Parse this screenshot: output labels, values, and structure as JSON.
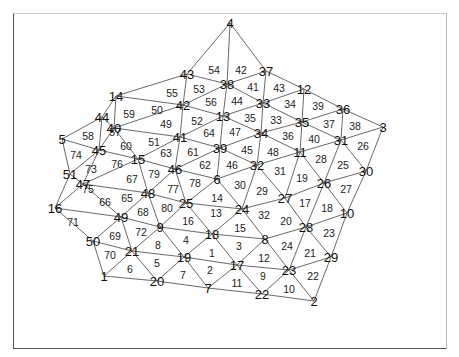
{
  "figure": {
    "type": "triangular-mesh",
    "nodes": [
      {
        "id": "4",
        "x": 230,
        "y": 23
      },
      {
        "id": "43",
        "x": 187,
        "y": 74
      },
      {
        "id": "37",
        "x": 266,
        "y": 71
      },
      {
        "id": "38",
        "x": 227,
        "y": 84
      },
      {
        "id": "14",
        "x": 116,
        "y": 96
      },
      {
        "id": "42",
        "x": 183,
        "y": 105
      },
      {
        "id": "12",
        "x": 304,
        "y": 89
      },
      {
        "id": "36",
        "x": 343,
        "y": 109
      },
      {
        "id": "33",
        "x": 263,
        "y": 103
      },
      {
        "id": "13",
        "x": 223,
        "y": 116
      },
      {
        "id": "35",
        "x": 302,
        "y": 122
      },
      {
        "id": "3",
        "x": 383,
        "y": 127
      },
      {
        "id": "44",
        "x": 102,
        "y": 117
      },
      {
        "id": "40",
        "x": 114,
        "y": 128
      },
      {
        "id": "5",
        "x": 62,
        "y": 139
      },
      {
        "id": "41",
        "x": 180,
        "y": 137
      },
      {
        "id": "34",
        "x": 261,
        "y": 133
      },
      {
        "id": "31",
        "x": 341,
        "y": 140
      },
      {
        "id": "39",
        "x": 220,
        "y": 148
      },
      {
        "id": "45",
        "x": 99,
        "y": 150
      },
      {
        "id": "15",
        "x": 138,
        "y": 159
      },
      {
        "id": "11",
        "x": 300,
        "y": 152
      },
      {
        "id": "30",
        "x": 366,
        "y": 171
      },
      {
        "id": "46",
        "x": 175,
        "y": 169
      },
      {
        "id": "6",
        "x": 217,
        "y": 179
      },
      {
        "id": "32",
        "x": 257,
        "y": 165
      },
      {
        "id": "51",
        "x": 70,
        "y": 174
      },
      {
        "id": "26",
        "x": 324,
        "y": 183
      },
      {
        "id": "47",
        "x": 83,
        "y": 184
      },
      {
        "id": "48",
        "x": 148,
        "y": 193
      },
      {
        "id": "27",
        "x": 285,
        "y": 198
      },
      {
        "id": "25",
        "x": 186,
        "y": 203
      },
      {
        "id": "24",
        "x": 242,
        "y": 209
      },
      {
        "id": "10",
        "x": 347,
        "y": 213
      },
      {
        "id": "16",
        "x": 55,
        "y": 208
      },
      {
        "id": "49",
        "x": 121,
        "y": 217
      },
      {
        "id": "9",
        "x": 160,
        "y": 227
      },
      {
        "id": "28",
        "x": 306,
        "y": 227
      },
      {
        "id": "18",
        "x": 212,
        "y": 234
      },
      {
        "id": "8",
        "x": 265,
        "y": 239
      },
      {
        "id": "50",
        "x": 93,
        "y": 241
      },
      {
        "id": "29",
        "x": 331,
        "y": 257
      },
      {
        "id": "21",
        "x": 132,
        "y": 251
      },
      {
        "id": "19",
        "x": 184,
        "y": 257
      },
      {
        "id": "17",
        "x": 237,
        "y": 265
      },
      {
        "id": "23",
        "x": 289,
        "y": 270
      },
      {
        "id": "1",
        "x": 104,
        "y": 276
      },
      {
        "id": "20",
        "x": 157,
        "y": 281
      },
      {
        "id": "7",
        "x": 208,
        "y": 288
      },
      {
        "id": "22",
        "x": 262,
        "y": 294
      },
      {
        "id": "2",
        "x": 314,
        "y": 301
      }
    ],
    "triangles": [
      {
        "id": "54",
        "x": 214,
        "y": 70
      },
      {
        "id": "42",
        "x": 241,
        "y": 70
      },
      {
        "id": "53",
        "x": 199,
        "y": 89
      },
      {
        "id": "41",
        "x": 253,
        "y": 87
      },
      {
        "id": "43",
        "x": 279,
        "y": 88
      },
      {
        "id": "55",
        "x": 172,
        "y": 93
      },
      {
        "id": "56",
        "x": 211,
        "y": 102
      },
      {
        "id": "44",
        "x": 237,
        "y": 101
      },
      {
        "id": "34",
        "x": 290,
        "y": 104
      },
      {
        "id": "39",
        "x": 318,
        "y": 106
      },
      {
        "id": "50",
        "x": 157,
        "y": 110
      },
      {
        "id": "59",
        "x": 129,
        "y": 114
      },
      {
        "id": "52",
        "x": 197,
        "y": 121
      },
      {
        "id": "35",
        "x": 250,
        "y": 118
      },
      {
        "id": "33",
        "x": 276,
        "y": 120
      },
      {
        "id": "37",
        "x": 329,
        "y": 124
      },
      {
        "id": "38",
        "x": 355,
        "y": 126
      },
      {
        "id": "49",
        "x": 166,
        "y": 124
      },
      {
        "id": "57",
        "x": 115,
        "y": 132
      },
      {
        "id": "58",
        "x": 88,
        "y": 136
      },
      {
        "id": "64",
        "x": 209,
        "y": 133
      },
      {
        "id": "47",
        "x": 235,
        "y": 132
      },
      {
        "id": "36",
        "x": 288,
        "y": 136
      },
      {
        "id": "40",
        "x": 314,
        "y": 139
      },
      {
        "id": "60",
        "x": 126,
        "y": 146
      },
      {
        "id": "51",
        "x": 154,
        "y": 142
      },
      {
        "id": "61",
        "x": 193,
        "y": 152
      },
      {
        "id": "45",
        "x": 247,
        "y": 150
      },
      {
        "id": "48",
        "x": 273,
        "y": 152
      },
      {
        "id": "63",
        "x": 166,
        "y": 153
      },
      {
        "id": "74",
        "x": 76,
        "y": 155
      },
      {
        "id": "26",
        "x": 363,
        "y": 146
      },
      {
        "id": "28",
        "x": 321,
        "y": 159
      },
      {
        "id": "76",
        "x": 117,
        "y": 164
      },
      {
        "id": "62",
        "x": 205,
        "y": 165
      },
      {
        "id": "46",
        "x": 232,
        "y": 165
      },
      {
        "id": "31",
        "x": 280,
        "y": 171
      },
      {
        "id": "25",
        "x": 343,
        "y": 165
      },
      {
        "id": "73",
        "x": 91,
        "y": 169
      },
      {
        "id": "79",
        "x": 154,
        "y": 174
      },
      {
        "id": "19",
        "x": 302,
        "y": 178
      },
      {
        "id": "67",
        "x": 132,
        "y": 179
      },
      {
        "id": "78",
        "x": 195,
        "y": 183
      },
      {
        "id": "30",
        "x": 240,
        "y": 185
      },
      {
        "id": "29",
        "x": 262,
        "y": 191
      },
      {
        "id": "75",
        "x": 88,
        "y": 189
      },
      {
        "id": "27",
        "x": 346,
        "y": 189
      },
      {
        "id": "77",
        "x": 173,
        "y": 189
      },
      {
        "id": "14",
        "x": 217,
        "y": 198
      },
      {
        "id": "17",
        "x": 305,
        "y": 203
      },
      {
        "id": "65",
        "x": 127,
        "y": 198
      },
      {
        "id": "66",
        "x": 105,
        "y": 202
      },
      {
        "id": "18",
        "x": 327,
        "y": 208
      },
      {
        "id": "80",
        "x": 167,
        "y": 208
      },
      {
        "id": "32",
        "x": 264,
        "y": 215
      },
      {
        "id": "13",
        "x": 216,
        "y": 213
      },
      {
        "id": "20",
        "x": 286,
        "y": 221
      },
      {
        "id": "16",
        "x": 188,
        "y": 221
      },
      {
        "id": "68",
        "x": 143,
        "y": 212
      },
      {
        "id": "71",
        "x": 73,
        "y": 222
      },
      {
        "id": "72",
        "x": 141,
        "y": 232
      },
      {
        "id": "15",
        "x": 240,
        "y": 228
      },
      {
        "id": "23",
        "x": 329,
        "y": 233
      },
      {
        "id": "69",
        "x": 115,
        "y": 236
      },
      {
        "id": "4",
        "x": 186,
        "y": 240
      },
      {
        "id": "8",
        "x": 158,
        "y": 245
      },
      {
        "id": "3",
        "x": 239,
        "y": 246
      },
      {
        "id": "24",
        "x": 287,
        "y": 246
      },
      {
        "id": "1",
        "x": 212,
        "y": 253
      },
      {
        "id": "70",
        "x": 110,
        "y": 255
      },
      {
        "id": "12",
        "x": 264,
        "y": 258
      },
      {
        "id": "21",
        "x": 310,
        "y": 253
      },
      {
        "id": "5",
        "x": 157,
        "y": 263
      },
      {
        "id": "2",
        "x": 210,
        "y": 270
      },
      {
        "id": "6",
        "x": 130,
        "y": 269
      },
      {
        "id": "9",
        "x": 263,
        "y": 276
      },
      {
        "id": "22",
        "x": 313,
        "y": 276
      },
      {
        "id": "7",
        "x": 183,
        "y": 275
      },
      {
        "id": "11",
        "x": 237,
        "y": 283
      },
      {
        "id": "10",
        "x": 289,
        "y": 289
      }
    ],
    "edges": [
      [
        "4",
        "43"
      ],
      [
        "4",
        "38"
      ],
      [
        "4",
        "37"
      ],
      [
        "43",
        "38"
      ],
      [
        "38",
        "37"
      ],
      [
        "43",
        "14"
      ],
      [
        "43",
        "42"
      ],
      [
        "38",
        "42"
      ],
      [
        "38",
        "13"
      ],
      [
        "38",
        "33"
      ],
      [
        "37",
        "33"
      ],
      [
        "37",
        "12"
      ],
      [
        "14",
        "42"
      ],
      [
        "14",
        "44"
      ],
      [
        "14",
        "40"
      ],
      [
        "42",
        "40"
      ],
      [
        "42",
        "13"
      ],
      [
        "42",
        "41"
      ],
      [
        "13",
        "33"
      ],
      [
        "13",
        "41"
      ],
      [
        "13",
        "34"
      ],
      [
        "13",
        "39"
      ],
      [
        "33",
        "12"
      ],
      [
        "33",
        "35"
      ],
      [
        "33",
        "34"
      ],
      [
        "12",
        "35"
      ],
      [
        "12",
        "36"
      ],
      [
        "35",
        "36"
      ],
      [
        "36",
        "3"
      ],
      [
        "36",
        "31"
      ],
      [
        "35",
        "31"
      ],
      [
        "35",
        "34"
      ],
      [
        "35",
        "11"
      ],
      [
        "3",
        "31"
      ],
      [
        "3",
        "30"
      ],
      [
        "44",
        "40"
      ],
      [
        "44",
        "5"
      ],
      [
        "44",
        "45"
      ],
      [
        "40",
        "45"
      ],
      [
        "40",
        "41"
      ],
      [
        "40",
        "15"
      ],
      [
        "5",
        "45"
      ],
      [
        "5",
        "51"
      ],
      [
        "41",
        "15"
      ],
      [
        "41",
        "39"
      ],
      [
        "41",
        "46"
      ],
      [
        "34",
        "39"
      ],
      [
        "34",
        "32"
      ],
      [
        "34",
        "11"
      ],
      [
        "31",
        "11"
      ],
      [
        "31",
        "30"
      ],
      [
        "31",
        "26"
      ],
      [
        "39",
        "46"
      ],
      [
        "39",
        "6"
      ],
      [
        "39",
        "32"
      ],
      [
        "45",
        "51"
      ],
      [
        "45",
        "15"
      ],
      [
        "45",
        "47"
      ],
      [
        "15",
        "46"
      ],
      [
        "15",
        "47"
      ],
      [
        "15",
        "48"
      ],
      [
        "11",
        "32"
      ],
      [
        "11",
        "26"
      ],
      [
        "11",
        "27"
      ],
      [
        "30",
        "26"
      ],
      [
        "30",
        "10"
      ],
      [
        "46",
        "6"
      ],
      [
        "46",
        "48"
      ],
      [
        "46",
        "25"
      ],
      [
        "6",
        "32"
      ],
      [
        "6",
        "25"
      ],
      [
        "6",
        "24"
      ],
      [
        "32",
        "24"
      ],
      [
        "32",
        "27"
      ],
      [
        "51",
        "47"
      ],
      [
        "51",
        "16"
      ],
      [
        "26",
        "27"
      ],
      [
        "26",
        "10"
      ],
      [
        "26",
        "28"
      ],
      [
        "47",
        "48"
      ],
      [
        "47",
        "16"
      ],
      [
        "47",
        "49"
      ],
      [
        "48",
        "49"
      ],
      [
        "48",
        "25"
      ],
      [
        "48",
        "9"
      ],
      [
        "27",
        "24"
      ],
      [
        "27",
        "28"
      ],
      [
        "25",
        "24"
      ],
      [
        "25",
        "9"
      ],
      [
        "25",
        "18"
      ],
      [
        "24",
        "18"
      ],
      [
        "24",
        "8"
      ],
      [
        "10",
        "28"
      ],
      [
        "10",
        "29"
      ],
      [
        "16",
        "49"
      ],
      [
        "16",
        "50"
      ],
      [
        "49",
        "9"
      ],
      [
        "49",
        "50"
      ],
      [
        "49",
        "21"
      ],
      [
        "9",
        "18"
      ],
      [
        "9",
        "21"
      ],
      [
        "9",
        "19"
      ],
      [
        "28",
        "8"
      ],
      [
        "28",
        "29"
      ],
      [
        "28",
        "23"
      ],
      [
        "18",
        "8"
      ],
      [
        "18",
        "19"
      ],
      [
        "18",
        "17"
      ],
      [
        "8",
        "17"
      ],
      [
        "8",
        "23"
      ],
      [
        "50",
        "21"
      ],
      [
        "50",
        "1"
      ],
      [
        "29",
        "23"
      ],
      [
        "29",
        "2"
      ],
      [
        "21",
        "19"
      ],
      [
        "21",
        "1"
      ],
      [
        "21",
        "20"
      ],
      [
        "19",
        "17"
      ],
      [
        "19",
        "20"
      ],
      [
        "19",
        "7"
      ],
      [
        "17",
        "23"
      ],
      [
        "17",
        "7"
      ],
      [
        "17",
        "22"
      ],
      [
        "23",
        "22"
      ],
      [
        "23",
        "2"
      ],
      [
        "1",
        "20"
      ],
      [
        "20",
        "7"
      ],
      [
        "7",
        "22"
      ],
      [
        "22",
        "2"
      ]
    ]
  }
}
